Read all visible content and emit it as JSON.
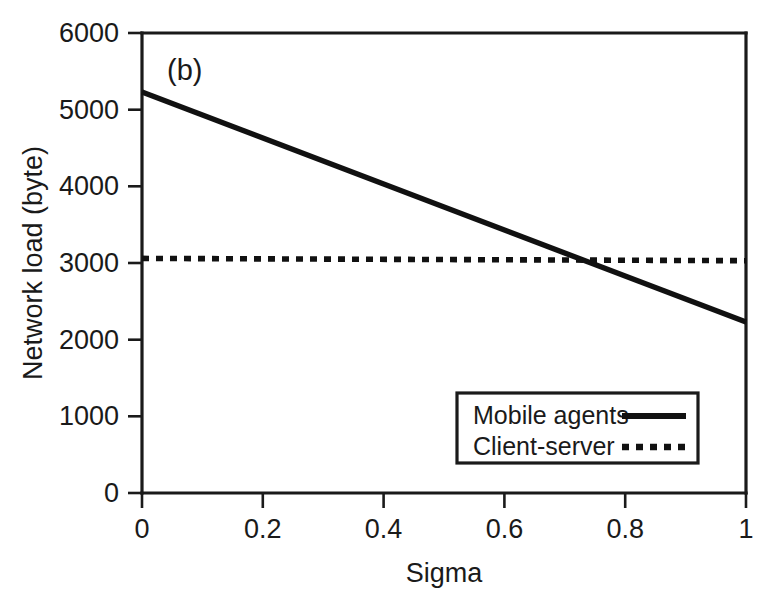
{
  "chart_data": {
    "type": "line",
    "title": "",
    "panel_label": "(b)",
    "xlabel": "Sigma",
    "ylabel": "Network load (byte)",
    "xlim": [
      0,
      1
    ],
    "ylim": [
      0,
      6000
    ],
    "grid": false,
    "xticks": [
      0,
      0.2,
      0.4,
      0.6,
      0.8,
      1
    ],
    "xtick_labels": [
      "0",
      "0.2",
      "0.4",
      "0.6",
      "0.8",
      "1"
    ],
    "yticks": [
      0,
      1000,
      2000,
      3000,
      4000,
      5000,
      6000
    ],
    "ytick_labels": [
      "0",
      "1000",
      "2000",
      "3000",
      "4000",
      "5000",
      "6000"
    ],
    "legend_position": "lower right",
    "x": [
      0,
      1
    ],
    "series": [
      {
        "name": "Mobile agents",
        "style": "solid",
        "color": "#111111",
        "values": [
          5230,
          2230
        ]
      },
      {
        "name": "Client-server",
        "style": "dotted",
        "color": "#111111",
        "values": [
          3060,
          3030
        ]
      }
    ],
    "annotations": [
      {
        "name": "crossover",
        "x": 0.745,
        "y": 3040
      }
    ]
  },
  "legend": {
    "entries": [
      {
        "label": "Mobile agents",
        "style": "solid"
      },
      {
        "label": "Client-server",
        "style": "dotted"
      }
    ]
  }
}
